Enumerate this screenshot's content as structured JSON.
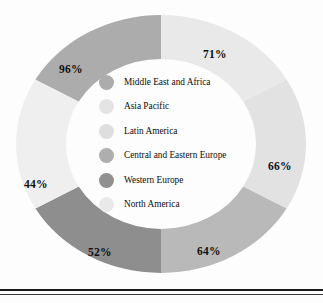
{
  "chart_data": {
    "type": "pie",
    "variant": "donut",
    "title": "",
    "xlabel": "",
    "ylabel": "",
    "legend_position": "center",
    "grid": false,
    "start_angle_deg": 0,
    "direction": "clockwise",
    "equal_slices": true,
    "categories": [
      "North America",
      "Western Europe",
      "Central and Eastern Europe",
      "Latin America",
      "Asia Pacific",
      "Middle East and Africa"
    ],
    "values": [
      71,
      66,
      64,
      52,
      44,
      96
    ],
    "data_labels": [
      "71%",
      "66%",
      "64%",
      "52%",
      "44%",
      "96%"
    ],
    "colors": [
      "#e9e9e9",
      "#e2e2e2",
      "#b9b9b9",
      "#8e8e8e",
      "#efefef",
      "#acacac"
    ],
    "segments": [
      {
        "label": "71%",
        "value": 71,
        "category": "North America",
        "color": "#e9e9e9",
        "start_deg": 0,
        "end_deg": 60
      },
      {
        "label": "66%",
        "value": 66,
        "category": "Western Europe",
        "color": "#e2e2e2",
        "start_deg": 60,
        "end_deg": 120
      },
      {
        "label": "64%",
        "value": 64,
        "category": "Central and Eastern Europe",
        "color": "#b9b9b9",
        "start_deg": 120,
        "end_deg": 180
      },
      {
        "label": "52%",
        "value": 52,
        "category": "Latin America",
        "color": "#8e8e8e",
        "start_deg": 180,
        "end_deg": 240
      },
      {
        "label": "44%",
        "value": 44,
        "category": "Asia Pacific",
        "color": "#efefef",
        "start_deg": 240,
        "end_deg": 300
      },
      {
        "label": "96%",
        "value": 96,
        "category": "Middle East and Africa",
        "color": "#acacac",
        "start_deg": 300,
        "end_deg": 360
      }
    ]
  },
  "legend": {
    "items": [
      {
        "label": "Middle East and Africa",
        "color": "#acacac",
        "value": 96
      },
      {
        "label": "Asia Pacific",
        "color": "#e4e4e4",
        "value": 44
      },
      {
        "label": "Latin America",
        "color": "#dedede",
        "value": 52
      },
      {
        "label": "Central and Eastern Europe",
        "color": "#aeaeae",
        "value": 64
      },
      {
        "label": "Western Europe",
        "color": "#909090",
        "value": 66
      },
      {
        "label": "North America",
        "color": "#e9e9e9",
        "value": 71
      }
    ]
  },
  "labels": {
    "pct_71": "71%",
    "pct_66": "66%",
    "pct_64": "64%",
    "pct_52": "52%",
    "pct_44": "44%",
    "pct_96": "96%"
  }
}
